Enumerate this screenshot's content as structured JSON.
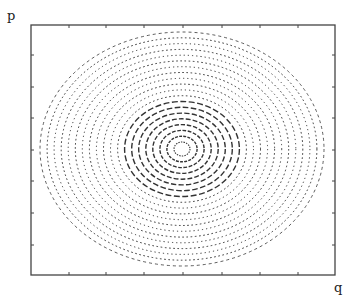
{
  "chart_data": {
    "type": "contour",
    "title": "",
    "xlabel": "q",
    "ylabel": "p",
    "grid": false,
    "legend": null,
    "frame": {
      "x0": 31,
      "y0": 25,
      "x1": 335,
      "y1": 275
    },
    "x_ticks_px": [
      69,
      106,
      144,
      183,
      222,
      260,
      298
    ],
    "y_ticks_px": [
      55,
      87,
      118,
      150,
      181,
      213,
      245
    ],
    "center_px": [
      182,
      149
    ],
    "ellipses": {
      "count": 20,
      "outer_rx": 142,
      "outer_ry": 117,
      "inner_rx": 8,
      "inner_ry": 7,
      "inner_dash_count": 9
    },
    "colors": {
      "line": "#333333",
      "frame": "#444444",
      "background": "#ffffff"
    }
  },
  "labels": {
    "y": "p",
    "x": "q"
  }
}
